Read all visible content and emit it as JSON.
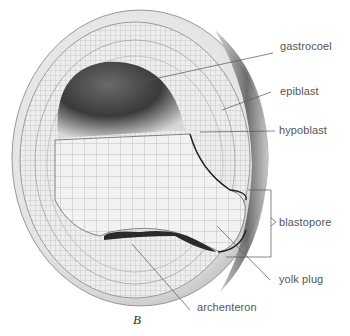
{
  "figure": {
    "caption": "B",
    "labels": {
      "gastrocoel": "gastrocoel",
      "epiblast": "epiblast",
      "hypoblast": "hypoblast",
      "blastopore": "blastopore",
      "yolk_plug": "yolk plug",
      "archenteron": "archenteron"
    }
  }
}
